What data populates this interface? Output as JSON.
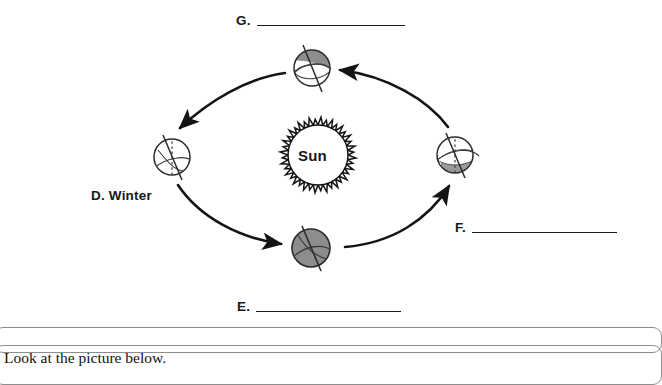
{
  "diagram": {
    "title_hidden": "",
    "sun": {
      "label": "Sun",
      "cx": 318,
      "cy": 155,
      "core_radius": 30,
      "ray_radius": 38,
      "ray_count": 40
    },
    "orbit": {
      "cx": 314,
      "cy": 157,
      "rx": 145,
      "ry": 95,
      "direction": "counterclockwise"
    },
    "earths": [
      {
        "id": "earth-top",
        "position": "top",
        "cx": 312,
        "cy": 68,
        "r": 18,
        "shading": "northern-hemisphere-shaded",
        "axis_tilt_deg": 23.5,
        "has_dashed_vertical": false,
        "fill": "#8d8d8d"
      },
      {
        "id": "earth-left",
        "position": "left",
        "cx": 172,
        "cy": 157,
        "r": 18,
        "shading": "unshaded",
        "axis_tilt_deg": 23.5,
        "has_dashed_vertical": true,
        "fill": "#ffffff"
      },
      {
        "id": "earth-bottom",
        "position": "bottom",
        "cx": 311,
        "cy": 248,
        "r": 19,
        "shading": "fully-shaded",
        "axis_tilt_deg": 23.5,
        "has_dashed_vertical": false,
        "fill": "#8d8d8d"
      },
      {
        "id": "earth-right",
        "position": "right",
        "cx": 455,
        "cy": 155,
        "r": 18,
        "shading": "southern-hemisphere-shaded",
        "axis_tilt_deg": 23.5,
        "has_dashed_vertical": true,
        "fill": "#ffffff"
      }
    ],
    "arrows": [
      {
        "id": "arrow-top-to-left",
        "from": "earth-top",
        "to": "earth-left"
      },
      {
        "id": "arrow-left-to-bottom",
        "from": "earth-left",
        "to": "earth-bottom"
      },
      {
        "id": "arrow-bottom-to-right",
        "from": "earth-bottom",
        "to": "earth-right"
      },
      {
        "id": "arrow-right-to-top",
        "from": "earth-right",
        "to": "earth-top"
      }
    ],
    "labels": {
      "g": {
        "key": "G.",
        "answer": ""
      },
      "e": {
        "key": "E.",
        "answer": ""
      },
      "f": {
        "key": "F.",
        "answer": ""
      },
      "d": "D. Winter"
    }
  },
  "page_chrome": {
    "next_question_text": "Look at the picture below."
  },
  "colors": {
    "ink": "#17181a",
    "shade_gray": "#8d8d8d",
    "rule": "#1b1c1e",
    "chrome_border": "#8c8d8f"
  }
}
